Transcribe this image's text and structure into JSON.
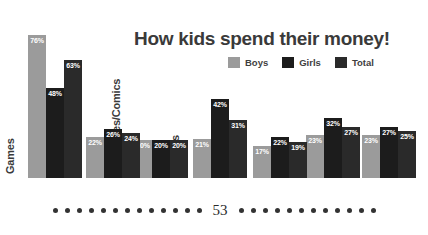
{
  "chart_data": {
    "type": "bar",
    "title": "How kids spend their money!",
    "xlabel": "",
    "ylabel": "",
    "ylim": [
      0,
      80
    ],
    "grid": false,
    "legend_position": "top-right",
    "categories": [
      "Games",
      "Sweets",
      "Magazines/Comics",
      "Clothes",
      "Shoes",
      "CDs",
      "Books"
    ],
    "series": [
      {
        "name": "Boys",
        "color": "#9b9b9b",
        "values": [
          76,
          22,
          20,
          21,
          17,
          23,
          23
        ]
      },
      {
        "name": "Girls",
        "color": "#1c1c1c",
        "values": [
          48,
          26,
          20,
          42,
          22,
          32,
          27
        ]
      },
      {
        "name": "Total",
        "color": "#2a2a2a",
        "values": [
          63,
          24,
          20,
          31,
          19,
          27,
          25
        ]
      }
    ],
    "value_label_suffix": "%"
  },
  "footer": {
    "page_number": "53",
    "dots_left": 13,
    "dots_right": 12
  }
}
